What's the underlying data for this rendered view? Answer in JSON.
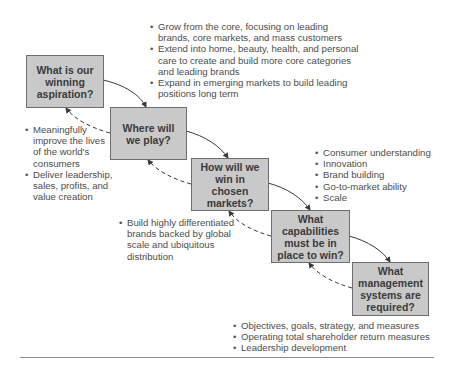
{
  "steps": [
    {
      "question": "What is our winning aspiration?"
    },
    {
      "question": "Where will we play?"
    },
    {
      "question": "How will we win in chosen markets?"
    },
    {
      "question": "What capabilities must be in place to win?"
    },
    {
      "question": "What management systems are required?"
    }
  ],
  "notes": {
    "aspiration": [
      "Meaningfully improve the lives of the world's consumers",
      "Deliver leadership, sales, profits, and value creation"
    ],
    "where_to_play": [
      "Grow from the core, focusing on leading brands, core markets, and mass customers",
      "Extend into home, beauty, health, and personal care to create and build more core categories and leading brands",
      "Expand in emerging markets to build leading positions long term"
    ],
    "how_to_win": [
      "Build highly differentiated brands backed by global scale and ubiquitous distribution"
    ],
    "capabilities": [
      "Consumer understanding",
      "Innovation",
      "Brand building",
      "Go-to-market ability",
      "Scale"
    ],
    "management_systems": [
      "Objectives, goals, strategy, and measures",
      "Operating total shareholder return measures",
      "Leadership development"
    ]
  },
  "colors": {
    "box_fill": "#c9c9c9",
    "box_border": "#6e6e6e",
    "arrow": "#3a3a3a",
    "text": "#4d4d4d"
  }
}
